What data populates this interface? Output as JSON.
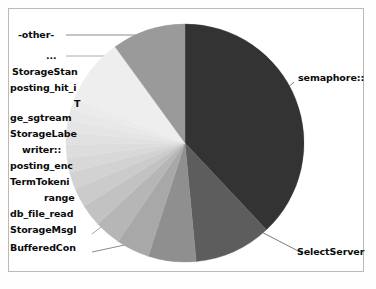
{
  "chart_data": {
    "type": "pie",
    "title": "",
    "legend_position": "callout-labels",
    "grid": false,
    "start_angle_deg": 0,
    "direction": "clockwise",
    "categories": [
      "semaphore::",
      "SelectServer",
      "BufferedCon",
      "StorageMsgl",
      "db_file_read",
      "range",
      "TermTokeni",
      "posting_enc",
      "writer::",
      "StorageLabe",
      "ge_sgtream",
      "T",
      "posting_hit_i",
      "StorageStan",
      "...",
      "-other-"
    ],
    "values": [
      38.0,
      10.5,
      6.5,
      4.5,
      3.6,
      3.0,
      2.6,
      2.3,
      2.0,
      1.8,
      1.7,
      1.6,
      1.5,
      1.4,
      9.0,
      10.0
    ],
    "colors": [
      "#333333",
      "#5d5d5d",
      "#8f8f8f",
      "#a8a8a8",
      "#b6b6b6",
      "#c2c2c2",
      "#cbcbcb",
      "#d2d2d2",
      "#d8d8d8",
      "#dddddd",
      "#e1e1e1",
      "#e5e5e5",
      "#e8e8e8",
      "#ebebeb",
      "#eeeeee",
      "#9a9a9a"
    ],
    "xlabel": "",
    "ylabel": ""
  },
  "labels": {
    "other": "-other-",
    "ellipsis": "...",
    "storage_stan": "StorageStan",
    "posting_hit_i": "posting_hit_i",
    "t": "T",
    "ge_sgtream": "ge_sgtream",
    "storage_labe": "StorageLabe",
    "writer": "writer::",
    "posting_enc": "posting_enc",
    "term_tokeni": "TermTokeni",
    "range": "range",
    "db_file_read": "db_file_read",
    "storage_msgl": "StorageMsgl",
    "buffered_con": "BufferedCon",
    "semaphore": "semaphore::",
    "select_server": "SelectServer"
  },
  "geometry": {
    "center_x": 185,
    "center_y": 143,
    "radius": 119
  },
  "style": {
    "frame_color": "#b9b9b9",
    "background": "#ffffff",
    "label_color": "#0b0b0b",
    "leader_color": "#707070"
  }
}
